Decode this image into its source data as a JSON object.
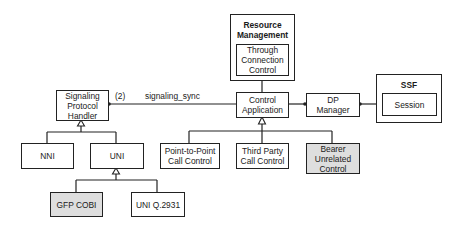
{
  "diagram": {
    "resource_management": {
      "title": "Resource\nManagement",
      "inner": "Through\nConnection\nControl"
    },
    "ssf": {
      "title": "SSF",
      "inner": "Session"
    },
    "nodes": {
      "signaling_protocol_handler": "Signaling\nProtocol\nHandler",
      "control_application": "Control\nApplication",
      "dp_manager": "DP\nManager",
      "nni": "NNI",
      "uni": "UNI",
      "gfp_cobi": "GFP COBI",
      "uni_q2931": "UNI Q.2931",
      "point_to_point": "Point-to-Point\nCall Control",
      "third_party": "Third Party\nCall Control",
      "bearer_unrelated": "Bearer\nUnrelated\nControl"
    },
    "edges": {
      "multiplicity": "(2)",
      "signaling_sync": "signaling_sync"
    },
    "colors": {
      "line": "#222222",
      "shaded_fill": "#dedede",
      "background": "#ffffff"
    }
  }
}
